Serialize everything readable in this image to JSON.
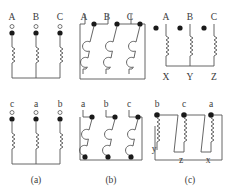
{
  "figure": {
    "title": "",
    "panels": [
      {
        "caption": "(a)",
        "top": {
          "terminals": [
            "A",
            "B",
            "C"
          ],
          "terminal_marker": "open-circle",
          "polarity_marker": "filled-dot",
          "winding": "star"
        },
        "bottom": {
          "terminals": [
            "c",
            "a",
            "b"
          ],
          "terminal_marker": "open-circle",
          "polarity_marker": "filled-dot",
          "winding": "star"
        }
      },
      {
        "caption": "(b)",
        "top": {
          "terminals": [
            "A",
            "B",
            "C"
          ],
          "terminal_marker": "none",
          "polarity_marker": "filled-dot",
          "winding": "delta"
        },
        "bottom": {
          "terminals": [
            "a",
            "b",
            "c"
          ],
          "terminal_marker": "none",
          "polarity_marker": "filled-dot",
          "winding": "delta"
        }
      },
      {
        "caption": "(c)",
        "top": {
          "terminals": [
            "A",
            "B",
            "C"
          ],
          "bottom_terminals": [
            "X",
            "Y",
            "Z"
          ],
          "terminal_marker": "none",
          "polarity_marker": "filled-dot",
          "winding": "star"
        },
        "bottom": {
          "terminals": [
            "b",
            "c",
            "a"
          ],
          "bottom_terminals": [
            "y",
            "z",
            "x"
          ],
          "terminal_marker": "none",
          "polarity_marker": "filled-dot",
          "winding": "delta"
        }
      }
    ]
  },
  "labels": {
    "a_top": [
      "A",
      "B",
      "C"
    ],
    "a_bottom": [
      "c",
      "a",
      "b"
    ],
    "b_top": [
      "A",
      "B",
      "C"
    ],
    "b_bottom": [
      "a",
      "b",
      "c"
    ],
    "c_top_upper": [
      "A",
      "B",
      "C"
    ],
    "c_top_lower": [
      "X",
      "Y",
      "Z"
    ],
    "c_bottom_upper": [
      "b",
      "c",
      "a"
    ],
    "c_bottom_lower": [
      "y",
      "z",
      "x"
    ],
    "captions": [
      "(a)",
      "(b)",
      "(c)"
    ]
  },
  "colors": {
    "line": "#555555",
    "text": "#3a3a3a",
    "dot_fill": "#1a1a1a",
    "background": "#ffffff"
  }
}
